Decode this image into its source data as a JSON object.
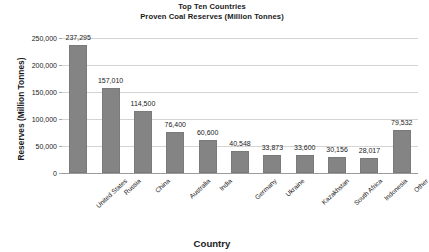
{
  "chart_data": {
    "type": "bar",
    "title": "Top Ten Countries Proven Coal Reserves (Million Tonnes)",
    "title_lines": [
      "Top Ten Countries",
      "Proven Coal Reserves (Million Tonnes)"
    ],
    "xlabel": "Country",
    "ylabel": "Reserves (Million Tonnes)",
    "ylim": [
      0,
      250000
    ],
    "ytick_step": 50000,
    "grid": true,
    "legend": false,
    "bar_color": "#848484",
    "gridline_color": "#d4d4d4",
    "categories": [
      "United States",
      "Russia",
      "China",
      "Australia",
      "India",
      "Germany",
      "Ukraine",
      "Kazakhstan",
      "South Africa",
      "Indonesia",
      "Other"
    ],
    "values": [
      237295,
      157010,
      114500,
      76400,
      60600,
      40548,
      33873,
      33600,
      30156,
      28017,
      79532
    ],
    "value_labels": [
      "237,295",
      "157,010",
      "114,500",
      "76,400",
      "60,600",
      "40,548",
      "33,873",
      "33,600",
      "30,156",
      "28,017",
      "79,532"
    ],
    "ytick_labels": [
      "0",
      "50,000",
      "100,000",
      "150,000",
      "200,000",
      "250,000"
    ],
    "ytick_values": [
      0,
      50000,
      100000,
      150000,
      200000,
      250000
    ]
  }
}
